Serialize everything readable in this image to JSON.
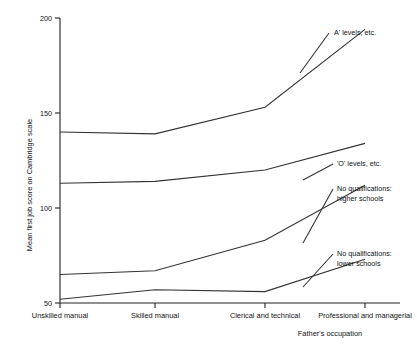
{
  "chart_data": {
    "type": "line",
    "title": "",
    "xlabel": "Father's occupation",
    "ylabel": "Mean first job score on Cambridge scale",
    "categories": [
      "Unskilled manual",
      "Skilled manual",
      "Clerical and technical",
      "Professional and managerial"
    ],
    "ylim": [
      50,
      200
    ],
    "yticks": [
      50,
      100,
      150,
      200
    ],
    "ytick_labels": [
      "50",
      "100",
      "150",
      "200"
    ],
    "grid": false,
    "legend_position": "right-inline-annotations",
    "series": [
      {
        "name": "A' levels, etc.",
        "annotation": "A' levels, etc.",
        "values": [
          140,
          139,
          153,
          194
        ]
      },
      {
        "name": "'O' levels, etc.",
        "annotation": "'O' levels, etc.",
        "values": [
          113,
          114,
          120,
          134
        ]
      },
      {
        "name": "No qualifications: higher schools",
        "annotation_line1": "No qualifications:",
        "annotation_line2": "higher schools",
        "values": [
          65,
          67,
          83,
          112
        ]
      },
      {
        "name": "No qualifications: lower schools",
        "annotation_line1": "No qualifications:",
        "annotation_line2": "lower schools",
        "values": [
          52,
          57,
          56,
          73
        ]
      }
    ]
  },
  "axes": {
    "y_title": "Mean first job score on Cambridge scale",
    "x_title": "Father's occupation",
    "y_tick_200": "200",
    "y_tick_150": "150",
    "y_tick_100": "100",
    "y_tick_50": "50"
  },
  "categories": {
    "c0": "Unskilled manual",
    "c1": "Skilled manual",
    "c2": "Clerical and technical",
    "c3": "Professional and managerial"
  },
  "annotations": {
    "a_levels": "A' levels, etc.",
    "o_levels": "'O' levels, etc.",
    "noqual_higher_1": "No qualifications:",
    "noqual_higher_2": "higher schools",
    "noqual_lower_1": "No qualifications:",
    "noqual_lower_2": "lower schools"
  }
}
